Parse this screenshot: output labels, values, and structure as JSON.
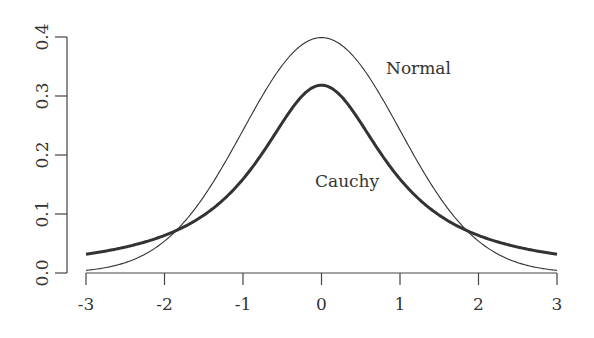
{
  "chart_data": {
    "type": "line",
    "title": "",
    "xlabel": "",
    "ylabel": "",
    "xlim": [
      -3,
      3
    ],
    "ylim": [
      0,
      0.4
    ],
    "grid": false,
    "x_ticks": [
      "-3",
      "-2",
      "-1",
      "0",
      "1",
      "2",
      "3"
    ],
    "y_ticks": [
      "0.0",
      "0.1",
      "0.2",
      "0.3",
      "0.4"
    ],
    "series": [
      {
        "name": "Normal",
        "style": "thin",
        "function": "standard normal density",
        "x": [
          -3,
          -2.5,
          -2,
          -1.5,
          -1,
          -0.5,
          0,
          0.5,
          1,
          1.5,
          2,
          2.5,
          3
        ],
        "values": [
          0.0044,
          0.0175,
          0.054,
          0.1295,
          0.242,
          0.3521,
          0.3989,
          0.3521,
          0.242,
          0.1295,
          0.054,
          0.0175,
          0.0044
        ]
      },
      {
        "name": "Cauchy",
        "style": "thick",
        "function": "standard Cauchy density",
        "x": [
          -3,
          -2.5,
          -2,
          -1.5,
          -1,
          -0.5,
          0,
          0.5,
          1,
          1.5,
          2,
          2.5,
          3
        ],
        "values": [
          0.0318,
          0.0439,
          0.0637,
          0.0979,
          0.1592,
          0.2546,
          0.3183,
          0.2546,
          0.1592,
          0.0979,
          0.0637,
          0.0439,
          0.0318
        ]
      }
    ],
    "annotations": [
      {
        "text": "Normal",
        "x": 0.8,
        "y": 0.345
      },
      {
        "text": "Cauchy",
        "x": -0.15,
        "y": 0.155
      }
    ]
  },
  "labels": {
    "normal": "Normal",
    "cauchy": "Cauchy"
  }
}
